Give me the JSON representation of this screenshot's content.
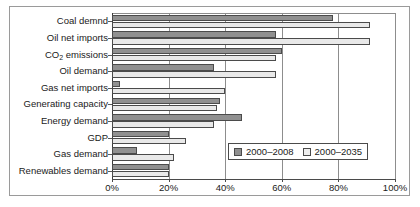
{
  "chart_data": {
    "type": "bar",
    "orientation": "horizontal",
    "title": "",
    "xlabel": "",
    "ylabel": "",
    "xlim": [
      0,
      100
    ],
    "xticks": [
      "0%",
      "20%",
      "40%",
      "60%",
      "80%",
      "100%"
    ],
    "xtick_values": [
      0,
      20,
      40,
      60,
      80,
      100
    ],
    "grid": "vertical",
    "legend_position": "inside-lower-right",
    "categories": [
      "Coal demnd",
      "Oil net imports",
      "CO2 emissions",
      "Oil demand",
      "Gas net imports",
      "Generating capacity",
      "Energy demand",
      "GDP",
      "Gas demand",
      "Renewables demand"
    ],
    "series": [
      {
        "name": "2000–2008",
        "color": "#909090",
        "values": [
          78,
          58,
          60,
          36,
          3,
          38,
          46,
          20,
          9,
          20
        ]
      },
      {
        "name": "2000–2035",
        "color": "#e9e9e9",
        "values": [
          91,
          91,
          58,
          58,
          40,
          37,
          36,
          26,
          22,
          20
        ]
      }
    ]
  },
  "labels": {
    "co2_prefix": "CO",
    "co2_sub": "2",
    "co2_suffix": " emissions"
  }
}
